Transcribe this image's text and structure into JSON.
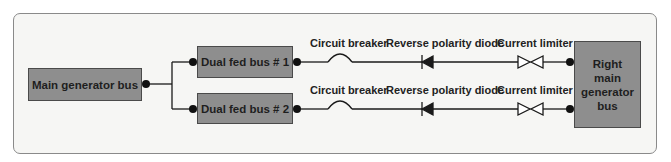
{
  "diagram": {
    "main_bus": {
      "label": "Main generator bus"
    },
    "dual_bus_1": {
      "label": "Dual fed bus # 1"
    },
    "dual_bus_2": {
      "label": "Dual fed bus # 2"
    },
    "right_bus": {
      "label": "Right main generator bus",
      "lines": [
        "Right",
        "main",
        "generator",
        "bus"
      ]
    },
    "row1": {
      "circuit_breaker": "Circuit breaker",
      "diode": "Reverse polarity diode",
      "current_limiter": "Current limiter"
    },
    "row2": {
      "circuit_breaker": "Circuit breaker",
      "diode": "Reverse polarity diode",
      "current_limiter": "Current limiter"
    },
    "colors": {
      "box_fill": "#8e8e8e",
      "box_border": "#4a4a4a",
      "wire": "#1a1a1a",
      "panel_bg": "#f6f6f4",
      "panel_border": "#8a8a8a"
    }
  }
}
